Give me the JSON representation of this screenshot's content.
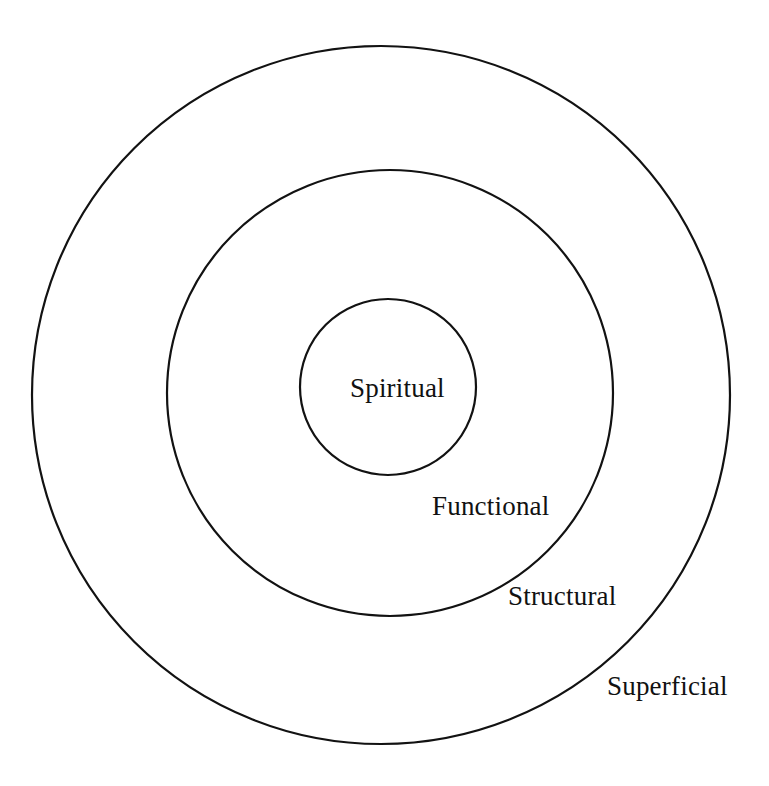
{
  "diagram": {
    "type": "concentric-circles",
    "background_color": "#ffffff",
    "stroke_color": "#121212",
    "text_color": "#111111",
    "canvas": {
      "width": 769,
      "height": 786
    },
    "rings": [
      {
        "key": "superficial",
        "label": "Superficial",
        "level": 4,
        "position": "outermost",
        "center_x": 381,
        "center_y": 395,
        "radius": 349,
        "stroke_width": 2.2,
        "label_x": 607,
        "label_y": 673
      },
      {
        "key": "structural",
        "label": "Structural",
        "level": 3,
        "position": "outer-middle",
        "center_x": 390,
        "center_y": 393,
        "radius": 223,
        "stroke_width": 2.2,
        "label_x": 508,
        "label_y": 583
      },
      {
        "key": "functional",
        "label": "Functional",
        "level": 2,
        "position": "inner-middle",
        "center_x": 388,
        "center_y": 387,
        "radius": 88,
        "stroke_width": 2.2,
        "label_x": 432,
        "label_y": 493
      },
      {
        "key": "spiritual",
        "label": "Spiritual",
        "level": 1,
        "position": "core",
        "center_x": 388,
        "center_y": 387,
        "radius": 0,
        "stroke_width": 0,
        "label_x": 350,
        "label_y": 375
      }
    ],
    "labels": {
      "spiritual": "Spiritual",
      "functional": "Functional",
      "structural": "Structural",
      "superficial": "Superficial"
    }
  }
}
